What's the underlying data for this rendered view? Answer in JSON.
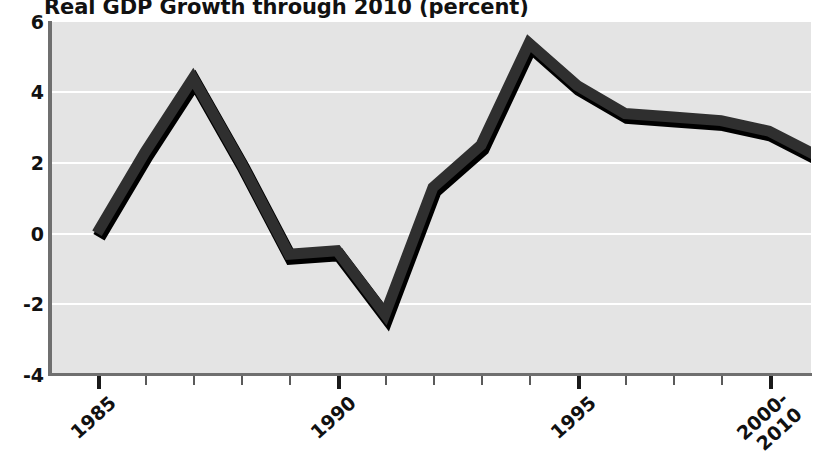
{
  "chart_data": {
    "type": "line",
    "title": "Real GDP Growth through 2010 (percent)",
    "xlabel": "",
    "ylabel": "",
    "ylim": [
      -4,
      6
    ],
    "yticks": [
      6,
      4,
      2,
      0,
      -2,
      -4
    ],
    "ytick_labels": [
      "6",
      "4",
      "2",
      "0",
      "-2",
      "-4"
    ],
    "grid": true,
    "grid_color": "#ffffff",
    "plot_background": "#e4e4e4",
    "line_color": "#2b2b2b",
    "legend": "none",
    "x": [
      1985,
      1986,
      1987,
      1988,
      1989,
      1990,
      1991,
      1992,
      1993,
      1994,
      1995,
      1996,
      1997,
      1998,
      1999,
      2000,
      2010
    ],
    "xtick_labels": [
      "1985",
      "1990",
      "1995",
      "2000-\n2010"
    ],
    "xticks_major": [
      1985,
      1990,
      1995,
      2000
    ],
    "categories": [
      "1985",
      "1986",
      "1987",
      "1988",
      "1989",
      "1990",
      "1991",
      "1992",
      "1993",
      "1994",
      "1995",
      "1996",
      "1997",
      "1998",
      "1999",
      "2000",
      "2010"
    ],
    "values": [
      0.0,
      2.3,
      4.4,
      2.0,
      -0.6,
      -0.5,
      -2.3,
      1.3,
      2.5,
      5.4,
      4.2,
      3.4,
      3.3,
      3.2,
      2.9,
      2.2,
      2.2
    ],
    "series": [
      {
        "name": "Real GDP Growth",
        "values": [
          0.0,
          2.3,
          4.4,
          2.0,
          -0.6,
          -0.5,
          -2.3,
          1.3,
          2.5,
          5.4,
          4.2,
          3.4,
          3.3,
          3.2,
          2.9,
          2.2,
          2.2
        ]
      }
    ],
    "axis_labels": {
      "x_start": "1985",
      "x_mid1": "1990",
      "x_mid2": "1995",
      "x_end_line1": "2000-",
      "x_end_line2": "2010"
    }
  }
}
